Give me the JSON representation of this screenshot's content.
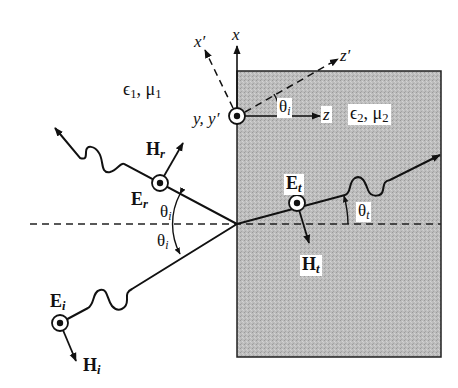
{
  "diagram": {
    "colors": {
      "ink": "#111111",
      "medium2_fill": "#b8b8b8",
      "background": "#ffffff"
    },
    "media": {
      "medium1": {
        "eps": "ϵ",
        "eps_sub": "1",
        "mu": "μ",
        "mu_sub": "1"
      },
      "medium2": {
        "eps": "ϵ",
        "eps_sub": "2",
        "mu": "μ",
        "mu_sub": "2"
      }
    },
    "axes": {
      "x": "x",
      "x_prime": "x′",
      "z": "z",
      "z_prime": "z′",
      "y_label": "y, y′"
    },
    "angles": {
      "coord_rotation": {
        "sym": "θ",
        "sub": "i"
      },
      "incident": {
        "sym": "θ",
        "sub": "i"
      },
      "reflected": {
        "sym": "θ",
        "sub": "i"
      },
      "transmitted": {
        "sym": "θ",
        "sub": "t"
      }
    },
    "waves": {
      "incident": {
        "E": "E",
        "E_sub": "i",
        "H": "H",
        "H_sub": "i"
      },
      "reflected": {
        "E": "E",
        "E_sub": "r",
        "H": "H",
        "H_sub": "r"
      },
      "transmitted": {
        "E": "E",
        "E_sub": "t",
        "H": "H",
        "H_sub": "t"
      }
    }
  }
}
